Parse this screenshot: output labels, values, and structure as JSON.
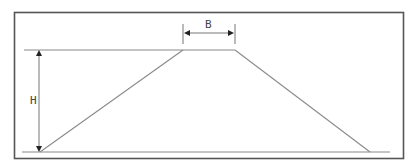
{
  "diagram": {
    "type": "trapezoid-cross-section",
    "labels": {
      "top_width": "B",
      "height": "H"
    },
    "colors": {
      "frame": "#555555",
      "lines": "#8a8a8a",
      "arrows": "#222222",
      "text": "#444444",
      "background": "#ffffff"
    }
  }
}
